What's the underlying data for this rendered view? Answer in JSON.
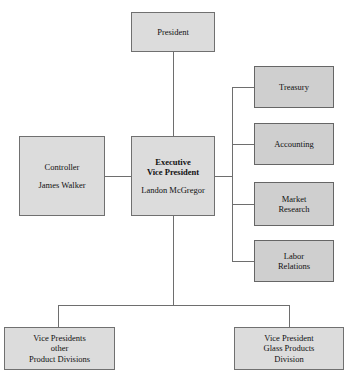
{
  "chart_data": {
    "type": "diagram",
    "diagram_type": "organization-chart",
    "title": "",
    "nodes": [
      {
        "id": "president",
        "lines": [
          "President"
        ]
      },
      {
        "id": "evp",
        "lines": [
          "Executive",
          "Vice President",
          "Landon McGregor"
        ]
      },
      {
        "id": "controller",
        "lines": [
          "Controller",
          "James Walker"
        ]
      },
      {
        "id": "treasury",
        "lines": [
          "Treasury"
        ]
      },
      {
        "id": "accounting",
        "lines": [
          "Accounting"
        ]
      },
      {
        "id": "market",
        "lines": [
          "Market",
          "Research"
        ]
      },
      {
        "id": "labor",
        "lines": [
          "Labor",
          "Relations"
        ]
      },
      {
        "id": "vps_other",
        "lines": [
          "Vice Presidents",
          "other",
          "Product Divisions"
        ]
      },
      {
        "id": "vp_glass",
        "lines": [
          "Vice President",
          "Glass Products",
          "Division"
        ]
      }
    ],
    "edges": [
      {
        "from": "president",
        "to": "evp"
      },
      {
        "from": "evp",
        "to": "controller"
      },
      {
        "from": "evp",
        "to": "treasury"
      },
      {
        "from": "evp",
        "to": "accounting"
      },
      {
        "from": "evp",
        "to": "market"
      },
      {
        "from": "evp",
        "to": "labor"
      },
      {
        "from": "evp",
        "to": "vps_other"
      },
      {
        "from": "evp",
        "to": "vp_glass"
      }
    ],
    "colors": {
      "node_fill": "#dcdcdc",
      "department_fill": "#cfcfcf",
      "node_border": "#707070",
      "connector": "#6e6e6e",
      "text": "#111111",
      "background": "#ffffff"
    }
  },
  "chart": {
    "president": {
      "line1": "President"
    },
    "evp": {
      "line1": "Executive",
      "line2": "Vice President",
      "line3": "Landon McGregor"
    },
    "controller": {
      "line1": "Controller",
      "line2": "James Walker"
    },
    "treasury": {
      "line1": "Treasury"
    },
    "accounting": {
      "line1": "Accounting"
    },
    "market_research": {
      "line1": "Market",
      "line2": "Research"
    },
    "labor_relations": {
      "line1": "Labor",
      "line2": "Relations"
    },
    "vps_other_divisions": {
      "line1": "Vice Presidents",
      "line2": "other",
      "line3": "Product Divisions"
    },
    "vp_glass_products": {
      "line1": "Vice President",
      "line2": "Glass Products",
      "line3": "Division"
    }
  }
}
